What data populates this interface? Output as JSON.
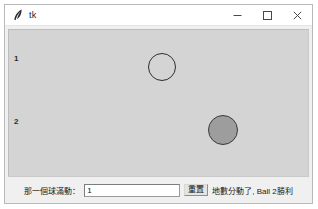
{
  "window": {
    "title": "tk",
    "icon": "feather-icon",
    "controls": {
      "minimize_label": "─",
      "maximize_label": "□",
      "close_label": "✕"
    }
  },
  "canvas": {
    "lanes": [
      {
        "label": "1"
      },
      {
        "label": "2"
      }
    ],
    "balls": [
      {
        "name": "ball-1",
        "lane": "1",
        "filled": false,
        "fill_color": "transparent",
        "outline_color": "#2e2e2e"
      },
      {
        "name": "ball-2",
        "lane": "2",
        "filled": true,
        "fill_color": "#9d9d9d",
        "outline_color": "#3a3a3a"
      }
    ],
    "background_color": "#d4d4d4"
  },
  "controls": {
    "speed_label": "那一個球滿動：",
    "speed_value": "1",
    "speed_placeholder": "",
    "reset_label": "重置",
    "status_text": "地數分動了, Ball 2勝利"
  }
}
